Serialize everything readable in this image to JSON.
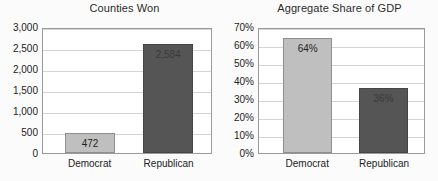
{
  "chart_data": [
    {
      "id": "counties-won",
      "type": "bar",
      "title": "Counties Won",
      "xlabel": "",
      "ylabel": "",
      "categories": [
        "Democrat",
        "Republican"
      ],
      "values": [
        472,
        2584
      ],
      "data_labels": [
        "472",
        "2,584"
      ],
      "bar_colors": [
        "#bfbfbf",
        "#555555"
      ],
      "ylim": [
        0,
        3000
      ],
      "ytick_values": [
        0,
        500,
        1000,
        1500,
        2000,
        2500,
        3000
      ],
      "ytick_labels": [
        "0",
        "500",
        "1,000",
        "1,500",
        "2,000",
        "2,500",
        "3,000"
      ],
      "grid": true,
      "legend": "none"
    },
    {
      "id": "aggregate-share-of-gdp",
      "type": "bar",
      "title": "Aggregate Share of GDP",
      "xlabel": "",
      "ylabel": "",
      "categories": [
        "Democrat",
        "Republican"
      ],
      "values": [
        64,
        36
      ],
      "data_labels": [
        "64%",
        "36%"
      ],
      "bar_colors": [
        "#bfbfbf",
        "#555555"
      ],
      "ylim": [
        0,
        70
      ],
      "ytick_values": [
        0,
        10,
        20,
        30,
        40,
        50,
        60,
        70
      ],
      "ytick_labels": [
        "0%",
        "10%",
        "20%",
        "30%",
        "40%",
        "50%",
        "60%",
        "70%"
      ],
      "grid": true,
      "legend": "none"
    }
  ],
  "colors": {
    "background": "#fbfbfb",
    "plot_background": "#ffffff",
    "gridline": "#d4d4d4",
    "axis_border": "#9a9a9a",
    "light_bar": "#bfbfbf",
    "dark_bar": "#555555",
    "text": "#222222"
  }
}
